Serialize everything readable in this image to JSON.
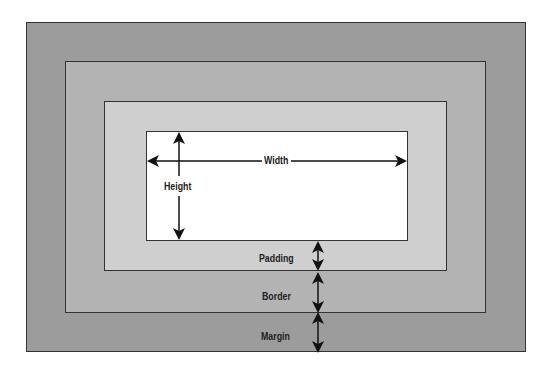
{
  "diagram": {
    "labels": {
      "width": "Width",
      "height": "Height",
      "padding": "Padding",
      "border": "Border",
      "margin": "Margin"
    },
    "colors": {
      "margin": "#9c9c9c",
      "border": "#b3b3b3",
      "padding": "#cfcfcf",
      "content": "#ffffff",
      "stroke": "#333333"
    }
  }
}
